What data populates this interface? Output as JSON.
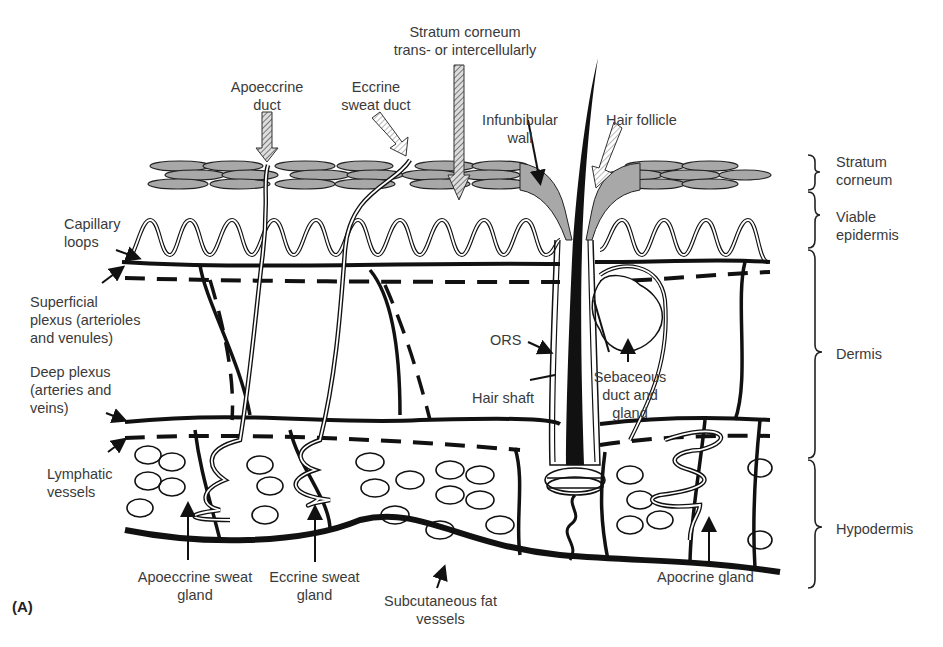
{
  "figure": {
    "panel_label": "(A)"
  },
  "routes": {
    "stratum_corneum": "Stratum corneum\ntrans- or intercellularly",
    "apoeccrine_duct": "Apoeccrine\nduct",
    "eccrine_sweat_duct": "Eccrine\nsweat duct",
    "infundibular_wall": "Infunbibular\nwall",
    "hair_follicle": "Hair follicle"
  },
  "left_labels": {
    "capillary_loops": "Capillary\nloops",
    "superficial_plexus": "Superficial\nplexus (arterioles\nand venules)",
    "deep_plexus": "Deep plexus\n(arteries and\nveins)",
    "lymphatic_vessels": "Lymphatic\nvessels"
  },
  "center_labels": {
    "ors": "ORS",
    "hair_shaft": "Hair shaft",
    "sebaceous": "Sebaceous\nduct and\ngland"
  },
  "bottom_labels": {
    "apoeccrine_gland": "Apoeccrine sweat\ngland",
    "eccrine_gland": "Eccrine sweat\ngland",
    "subcutaneous": "Subcutaneous fat\nvessels",
    "apocrine_gland": "Apocrine gland"
  },
  "layers": [
    {
      "name": "Stratum\ncorneum"
    },
    {
      "name": "Viable\nepidermis"
    },
    {
      "name": "Dermis"
    },
    {
      "name": "Hypodermis"
    }
  ],
  "colors": {
    "ink": "#111111",
    "corneocyte_fill": "#a8a8a8",
    "text": "#3a3a3a",
    "background": "#ffffff"
  }
}
